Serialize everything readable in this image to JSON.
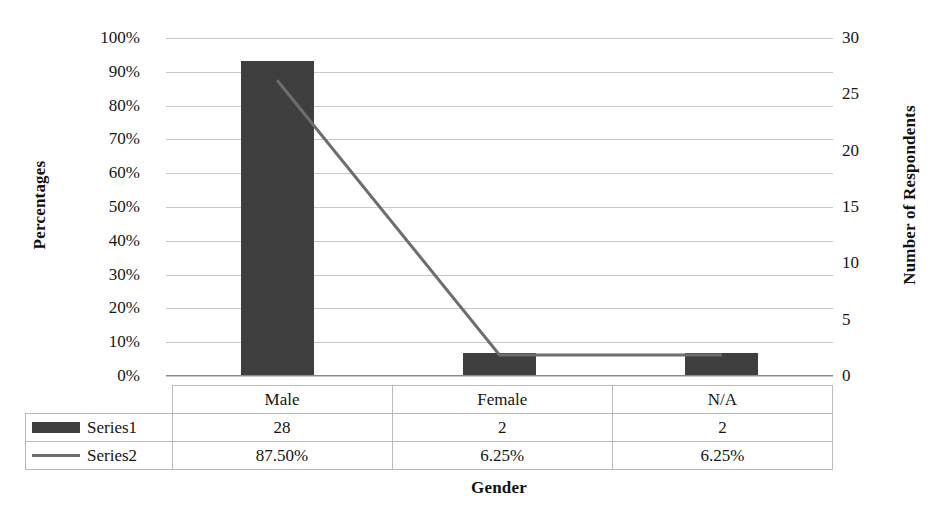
{
  "chart_data": {
    "type": "bar",
    "title": "",
    "subtitle": "",
    "xlabel": "Gender",
    "ylabel": "Percentages",
    "y2label": "Number of Respondents",
    "categories": [
      "Male",
      "Female",
      "N/A"
    ],
    "series": [
      {
        "name": "Series1",
        "type": "bar",
        "axis": "right",
        "values": [
          28,
          2,
          2
        ],
        "labels": [
          "28",
          "2",
          "2"
        ],
        "color": "#3f3f3f"
      },
      {
        "name": "Series2",
        "type": "line",
        "axis": "left",
        "values": [
          87.5,
          6.25,
          6.25
        ],
        "labels": [
          "87.50%",
          "6.25%",
          "6.25%"
        ],
        "color": "#6d6d6d"
      }
    ],
    "ylim": [
      0,
      100
    ],
    "y2lim": [
      0,
      30
    ],
    "yticks": [
      "0%",
      "10%",
      "20%",
      "30%",
      "40%",
      "50%",
      "60%",
      "70%",
      "80%",
      "90%",
      "100%"
    ],
    "y2ticks": [
      "0",
      "5",
      "10",
      "15",
      "20",
      "25",
      "30"
    ],
    "grid": true,
    "legend_position": "data-table-left",
    "data_table": {
      "visible": true,
      "column_headers": [
        "Male",
        "Female",
        "N/A"
      ],
      "rows": [
        {
          "label": "Series1",
          "marker": "bar-swatch",
          "cells": [
            "28",
            "2",
            "2"
          ]
        },
        {
          "label": "Series2",
          "marker": "line-swatch",
          "cells": [
            "87.50%",
            "6.25%",
            "6.25%"
          ]
        }
      ]
    }
  },
  "colors": {
    "bar": "#3f3f3f",
    "line": "#6d6d6d",
    "gridline": "#c8c8c8",
    "gridline_minor": "#d9d9d9",
    "table_border": "#b9b9b9",
    "text": "#141414",
    "background": "#ffffff"
  }
}
